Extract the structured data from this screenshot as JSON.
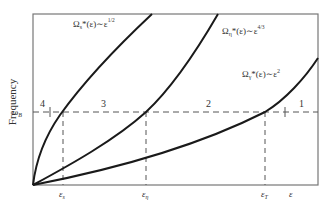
{
  "diagram": {
    "y_axis_label": "Frequency",
    "x_axis_symbol": "ε",
    "horizontal_line_label": "ω",
    "horizontal_line_subscript": "B",
    "curves": [
      {
        "id": "s",
        "label_main": "Ω",
        "label_sub": "s",
        "label_rest": "*(ε)∼ε",
        "exponent": "1/2"
      },
      {
        "id": "eta",
        "label_main": "Ω",
        "label_sub": "η",
        "label_rest": "*(ε)∼ε",
        "exponent": "4/3"
      },
      {
        "id": "gamma",
        "label_main": "Ω",
        "label_sub": "γ",
        "label_rest": "*(ε)∼ε",
        "exponent": "2"
      }
    ],
    "x_ticks": [
      {
        "main": "ε",
        "sub": "s"
      },
      {
        "main": "ε",
        "sub": "η"
      },
      {
        "main": "ε",
        "sub": "T"
      }
    ],
    "regions": [
      "4",
      "3",
      "2",
      "1"
    ],
    "colors": {
      "line": "#1a1a1a",
      "frame": "#777777",
      "text": "#333333",
      "background": "#ffffff"
    }
  }
}
